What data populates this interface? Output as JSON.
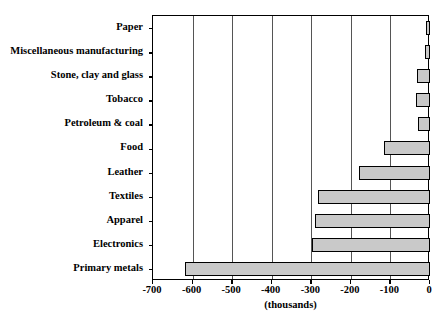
{
  "chart_data": {
    "type": "bar",
    "orientation": "horizontal",
    "title": "",
    "subtitle": "",
    "xlabel": "(thousands)",
    "ylabel": "",
    "xlim": [
      -700,
      0
    ],
    "ylim": null,
    "grid": true,
    "legend": null,
    "legend_position": "none",
    "xticks": [
      -700,
      -600,
      -500,
      -400,
      -300,
      -200,
      -100,
      0
    ],
    "xticklabels": [
      "-700",
      "-600",
      "-500",
      "-400",
      "-300",
      "-200",
      "-100",
      "0"
    ],
    "categories": [
      "Paper",
      "Miscellaneous manufacturing",
      "Stone, clay and glass",
      "Tobacco",
      "Petroleum & coal",
      "Food",
      "Leather",
      "Textiles",
      "Apparel",
      "Electronics",
      "Primary metals"
    ],
    "values": [
      -10,
      -12,
      -33,
      -35,
      -30,
      -115,
      -180,
      -283,
      -290,
      -298,
      -618
    ],
    "series": [
      {
        "name": "Employment change",
        "values": [
          -10,
          -12,
          -33,
          -35,
          -30,
          -115,
          -180,
          -283,
          -290,
          -298,
          -618
        ]
      }
    ],
    "bar_fill_color": "#c9c9c9",
    "bar_edge_color": "#000000",
    "gridline_color": "#555555",
    "axis_color": "#000000",
    "background_color": "#ffffff"
  }
}
